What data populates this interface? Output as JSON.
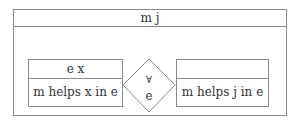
{
  "diagram": {
    "outer": {
      "title": "m j"
    },
    "left_box": {
      "header": "e x",
      "body": "m helps x in e"
    },
    "connector": {
      "symbol": "∀",
      "label": "e"
    },
    "right_box": {
      "header": "",
      "body": "m helps j in e"
    },
    "colors": {
      "stroke": "#8a8a8a",
      "text": "#333333",
      "background": "#ffffff"
    }
  }
}
